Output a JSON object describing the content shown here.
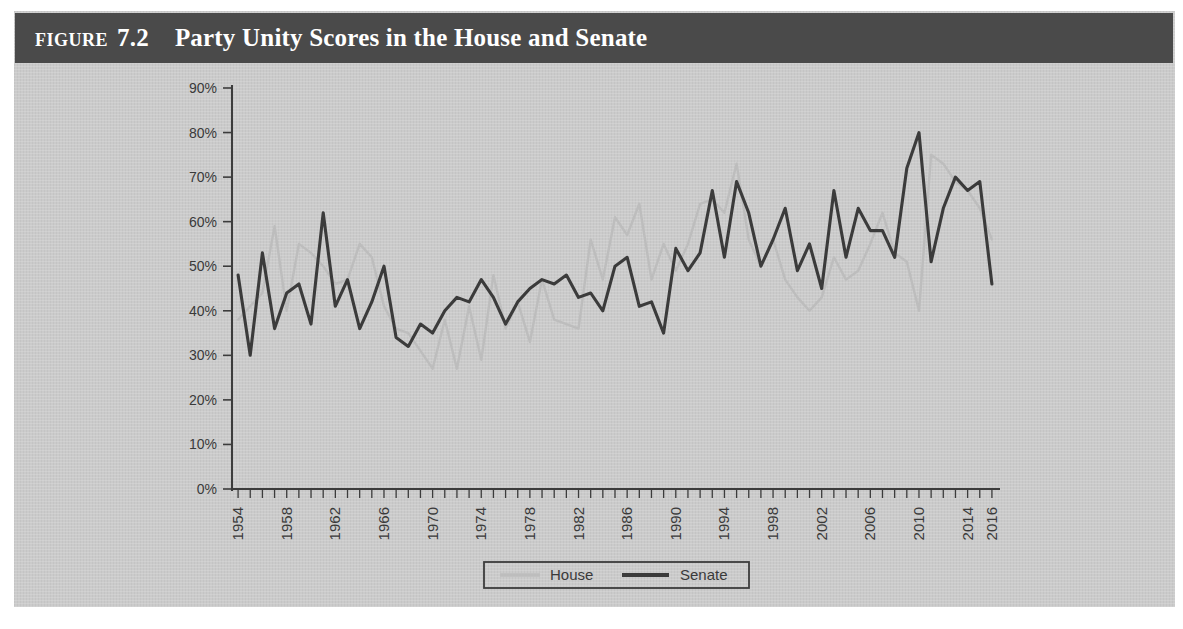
{
  "figure": {
    "label": "Figure",
    "number": "7.2",
    "title": "Party Unity Scores in the House and Senate",
    "header_bg": "#4a4a4a",
    "body_bg": "#c9c9c9"
  },
  "legend": {
    "position": "bottom-center",
    "entries": [
      {
        "name": "House",
        "label": "House",
        "color": "#bdbdbd"
      },
      {
        "name": "Senate",
        "label": "Senate",
        "color": "#3b3b3b"
      }
    ]
  },
  "chart_data": {
    "type": "line",
    "title": "Party Unity Scores in the House and Senate",
    "xlabel": "",
    "ylabel": "",
    "ylim": [
      0,
      90
    ],
    "xlim": [
      1954,
      2017
    ],
    "grid": false,
    "ytick_labels": [
      "90%",
      "80%",
      "70%",
      "60%",
      "50%",
      "40%",
      "30%",
      "20%",
      "10%",
      "0%"
    ],
    "ytick_values": [
      90,
      80,
      70,
      60,
      50,
      40,
      30,
      20,
      10,
      0
    ],
    "xtick_labels": [
      "1954",
      "1958",
      "1962",
      "1966",
      "1970",
      "1974",
      "1978",
      "1982",
      "1986",
      "1990",
      "1994",
      "1998",
      "2002",
      "2006",
      "2010",
      "2014",
      "2016"
    ],
    "xtick_values": [
      1954,
      1958,
      1962,
      1966,
      1970,
      1974,
      1978,
      1982,
      1986,
      1990,
      1994,
      1998,
      2002,
      2006,
      2010,
      2014,
      2016
    ],
    "x": [
      1954,
      1955,
      1956,
      1957,
      1958,
      1959,
      1960,
      1961,
      1962,
      1963,
      1964,
      1965,
      1966,
      1967,
      1968,
      1969,
      1970,
      1971,
      1972,
      1973,
      1974,
      1975,
      1976,
      1977,
      1978,
      1979,
      1980,
      1981,
      1982,
      1983,
      1984,
      1985,
      1986,
      1987,
      1988,
      1989,
      1990,
      1991,
      1992,
      1993,
      1994,
      1995,
      1996,
      1997,
      1998,
      1999,
      2000,
      2001,
      2002,
      2003,
      2004,
      2005,
      2006,
      2007,
      2008,
      2009,
      2010,
      2011,
      2012,
      2013,
      2014,
      2015,
      2016
    ],
    "series": [
      {
        "name": "Senate",
        "color": "#3b3b3b",
        "values": [
          48,
          30,
          53,
          36,
          44,
          46,
          37,
          62,
          41,
          47,
          36,
          42,
          50,
          34,
          32,
          37,
          35,
          40,
          43,
          42,
          47,
          43,
          37,
          42,
          45,
          47,
          46,
          48,
          43,
          44,
          40,
          50,
          52,
          41,
          42,
          35,
          54,
          49,
          53,
          67,
          52,
          69,
          62,
          50,
          56,
          63,
          49,
          55,
          45,
          67,
          52,
          63,
          58,
          58,
          52,
          72,
          80,
          51,
          63,
          70,
          67,
          69,
          46
        ]
      },
      {
        "name": "House",
        "color": "#bdbdbd",
        "values": [
          38,
          41,
          44,
          59,
          40,
          55,
          53,
          50,
          46,
          47,
          55,
          52,
          41,
          36,
          35,
          31,
          27,
          38,
          27,
          41,
          29,
          48,
          36,
          42,
          33,
          47,
          38,
          37,
          36,
          56,
          47,
          61,
          57,
          64,
          47,
          55,
          49,
          55,
          64,
          65,
          62,
          73,
          56,
          50,
          56,
          47,
          43,
          40,
          43,
          52,
          47,
          49,
          55,
          62,
          53,
          51,
          40,
          75,
          73,
          69,
          67,
          63,
          56
        ]
      }
    ]
  }
}
